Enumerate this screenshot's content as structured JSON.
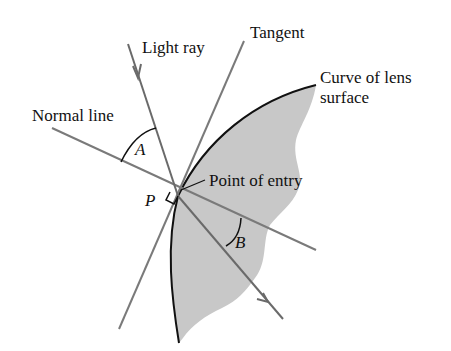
{
  "diagram": {
    "labels": {
      "light_ray": "Light ray",
      "tangent": "Tangent",
      "curve_line1": "Curve of lens",
      "curve_line2": "surface",
      "normal_line": "Normal line",
      "point_of_entry": "Point of entry",
      "angle_a": "A",
      "angle_b": "B",
      "point_p": "P"
    },
    "colors": {
      "lens_fill": "#c8c8c8",
      "line_gray": "#7a7a7a",
      "curve_black": "#111111",
      "text": "#111111"
    }
  }
}
